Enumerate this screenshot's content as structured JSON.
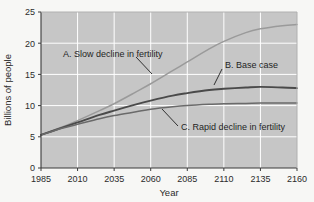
{
  "chart_data": {
    "type": "line",
    "title": "",
    "xlabel": "Year",
    "ylabel": "Billions of people",
    "xlim": [
      1985,
      2160
    ],
    "ylim": [
      0,
      25
    ],
    "grid": true,
    "legend_position": "inline-annotations",
    "xticks": [
      "1985",
      "2010",
      "2035",
      "2060",
      "2085",
      "2110",
      "2135",
      "2160"
    ],
    "yticks": [
      "0",
      "5",
      "10",
      "15",
      "20",
      "25"
    ],
    "x": [
      1985,
      2000,
      2010,
      2025,
      2035,
      2050,
      2060,
      2075,
      2085,
      2100,
      2110,
      2125,
      2135,
      2150,
      2160
    ],
    "series": [
      {
        "name": "A. Slow decline in fertility",
        "label": "A. Slow decline in fertility",
        "color": "#9a9a9a",
        "values": [
          5.3,
          6.6,
          7.6,
          9.2,
          10.3,
          12.2,
          13.5,
          15.6,
          17.0,
          19.1,
          20.3,
          21.7,
          22.3,
          22.8,
          23.0
        ]
      },
      {
        "name": "B. Base case",
        "label": "B. Base case",
        "color": "#4a4a4a",
        "values": [
          5.3,
          6.5,
          7.3,
          8.5,
          9.2,
          10.2,
          10.8,
          11.6,
          12.0,
          12.5,
          12.7,
          12.9,
          13.0,
          12.9,
          12.8
        ]
      },
      {
        "name": "C. Rapid decline in fertility",
        "label": "C. Rapid decline in fertility",
        "color": "#6a6a6a",
        "values": [
          5.3,
          6.4,
          7.0,
          7.9,
          8.4,
          9.0,
          9.4,
          9.8,
          10.0,
          10.2,
          10.3,
          10.35,
          10.4,
          10.4,
          10.4
        ]
      }
    ],
    "annotations": [
      {
        "text": "A. Slow decline in fertility",
        "leader": "down-right"
      },
      {
        "text": "B. Base case",
        "leader": "down-left"
      },
      {
        "text": "C. Rapid decline in fertility",
        "leader": "up-left"
      }
    ],
    "colors": {
      "plot_background": "#c6c6c6",
      "figure_background": "#f7f7f5",
      "gridline": "#ffffff",
      "axis": "#3a3a3a",
      "text": "#2b2b2b"
    }
  }
}
